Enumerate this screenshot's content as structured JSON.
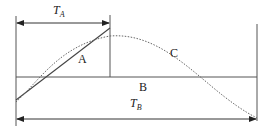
{
  "diagram": {
    "labels": {
      "ta_main": "T",
      "ta_sub": "A",
      "tb_main": "T",
      "tb_sub": "B",
      "region_a": "A",
      "region_b": "B",
      "curve_c": "C"
    },
    "colors": {
      "line": "#555555",
      "dotted": "#666666",
      "text": "#222222"
    }
  }
}
